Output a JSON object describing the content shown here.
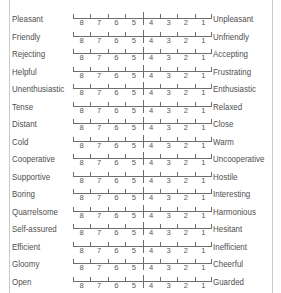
{
  "panel": {
    "clipped_header_text": "",
    "scale_points": [
      "8",
      "7",
      "6",
      "5",
      "4",
      "3",
      "2",
      "1"
    ],
    "divider_after_index": 3
  },
  "items": [
    {
      "left": "Pleasant",
      "right": "Unpleasant"
    },
    {
      "left": "Friendly",
      "right": "Unfriendly"
    },
    {
      "left": "Rejecting",
      "right": "Accepting"
    },
    {
      "left": "Helpful",
      "right": "Frustrating"
    },
    {
      "left": "Unenthusiastic",
      "right": "Enthusiastic"
    },
    {
      "left": "Tense",
      "right": "Relaxed"
    },
    {
      "left": "Distant",
      "right": "Close"
    },
    {
      "left": "Cold",
      "right": "Warm"
    },
    {
      "left": "Cooperative",
      "right": "Uncooperative"
    },
    {
      "left": "Supportive",
      "right": "Hostile"
    },
    {
      "left": "Boring",
      "right": "Interesting"
    },
    {
      "left": "Quarrelsome",
      "right": "Harmonious"
    },
    {
      "left": "Self-assured",
      "right": "Hesitant"
    },
    {
      "left": "Efficient",
      "right": "Inefficient"
    },
    {
      "left": "Gloomy",
      "right": "Cheerful"
    },
    {
      "left": "Open",
      "right": "Guarded"
    }
  ]
}
